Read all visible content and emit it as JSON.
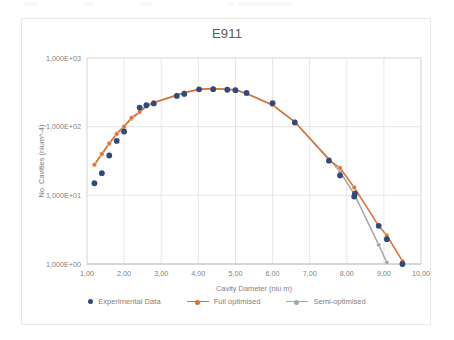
{
  "chart_data": {
    "type": "scatter",
    "title": "E911",
    "xlabel": "Cavity Dameter (niu m)",
    "ylabel": "No. Cavities (nium^-4)",
    "xlim": [
      1,
      10
    ],
    "ylim": [
      1,
      1000
    ],
    "yscale": "log",
    "xscale": "linear",
    "grid": true,
    "legend_position": "bottom",
    "xticklabels": [
      "1,00",
      "2,00",
      "3,00",
      "4,00",
      "5,00",
      "6,00",
      "7,00",
      "8,00",
      "9,00",
      "10,00"
    ],
    "xtickvalues": [
      1,
      2,
      3,
      4,
      5,
      6,
      7,
      8,
      9,
      10
    ],
    "yticklabels": [
      "1,000E+00",
      "1,000E+01",
      "1,000E+02",
      "1,000E+03"
    ],
    "ytickvalues": [
      1,
      10,
      100,
      1000
    ],
    "series": [
      {
        "name": "Experimental Data",
        "type": "scatter",
        "color": "#2E4B7C",
        "marker": "circle",
        "x": [
          1.2,
          1.4,
          1.6,
          1.8,
          2.0,
          2.42,
          2.6,
          2.8,
          3.42,
          3.62,
          4.02,
          4.4,
          4.78,
          5.0,
          5.3,
          6.0,
          6.6,
          7.52,
          7.82,
          8.2,
          8.22,
          8.86,
          9.08,
          9.5
        ],
        "y": [
          15.0,
          21.0,
          38.0,
          62.0,
          85.0,
          190.0,
          205.0,
          218.0,
          280.0,
          300.0,
          350.0,
          352.0,
          345.0,
          340.0,
          310.0,
          220.0,
          115.0,
          32.0,
          19.5,
          9.6,
          10.6,
          3.6,
          2.3,
          1.0
        ]
      },
      {
        "name": "Full optimised",
        "type": "line",
        "color": "#E0702B",
        "marker": "circle",
        "x": [
          1.2,
          1.4,
          1.6,
          1.8,
          2.0,
          2.2,
          2.42,
          2.6,
          2.8,
          3.42,
          3.62,
          4.02,
          4.4,
          4.78,
          5.0,
          5.3,
          6.0,
          6.6,
          7.52,
          7.82,
          8.2,
          8.86,
          9.08,
          9.5
        ],
        "y": [
          28.0,
          40.0,
          57.0,
          78.0,
          100.0,
          135.0,
          165.0,
          200.0,
          225.0,
          290.0,
          315.0,
          350.0,
          360.0,
          350.0,
          345.0,
          305.0,
          208.0,
          118.0,
          33.0,
          25.0,
          13.0,
          3.6,
          2.6,
          1.1
        ]
      },
      {
        "name": "Semi-optimised",
        "type": "line",
        "color": "#A6A6A6",
        "marker": "circle",
        "x": [
          1.2,
          1.4,
          1.6,
          1.8,
          2.0,
          2.2,
          2.42,
          2.6,
          2.8,
          3.42,
          3.62,
          4.02,
          4.4,
          4.78,
          5.0,
          5.3,
          6.0,
          6.6,
          7.52,
          7.82,
          8.2,
          8.86,
          9.08
        ],
        "y": [
          28.0,
          40.0,
          57.0,
          80.0,
          102.0,
          130.0,
          160.0,
          198.0,
          222.0,
          285.0,
          312.0,
          348.0,
          358.0,
          348.0,
          342.0,
          302.0,
          205.0,
          116.0,
          34.0,
          22.0,
          10.5,
          1.9,
          1.05
        ]
      }
    ]
  },
  "legend": {
    "items": [
      {
        "label": "Experimental Data",
        "color": "#2E4B7C",
        "style": "marker"
      },
      {
        "label": "Full optimised",
        "color": "#E0702B",
        "style": "line-marker"
      },
      {
        "label": "Semi-optimised",
        "color": "#A6A6A6",
        "style": "line-marker"
      }
    ]
  }
}
